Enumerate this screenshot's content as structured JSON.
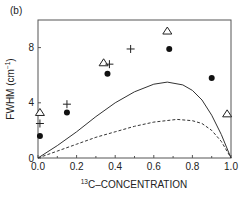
{
  "panel_label": "(b)",
  "chart_data": {
    "type": "scatter",
    "title": "",
    "xlabel_sup": "13",
    "xlabel": "C–CONCENTRATION",
    "ylabel": "FWHM (cm",
    "ylabel_sup": "−1",
    "ylabel_end": ")",
    "xlim": [
      0,
      1.0
    ],
    "ylim": [
      0,
      10
    ],
    "xticks": [
      0.0,
      0.2,
      0.4,
      0.6,
      0.8,
      1.0
    ],
    "xtick_labels": [
      "0.0",
      "0.2",
      "0.4",
      "0.6",
      "0.8",
      "1.0"
    ],
    "yticks": [
      0,
      4,
      8
    ],
    "ytick_labels": [
      "0",
      "4",
      "8"
    ],
    "grid": false,
    "legend": null,
    "series": [
      {
        "name": "triangles",
        "marker": "open-triangle",
        "points": [
          [
            0.01,
            3.3
          ],
          [
            0.34,
            6.9
          ],
          [
            0.67,
            9.2
          ],
          [
            0.98,
            3.2
          ]
        ]
      },
      {
        "name": "plus",
        "marker": "plus",
        "points": [
          [
            0.01,
            2.5
          ],
          [
            0.15,
            3.9
          ],
          [
            0.37,
            6.8
          ],
          [
            0.48,
            7.9
          ]
        ]
      },
      {
        "name": "filled-circles",
        "marker": "filled-circle",
        "points": [
          [
            0.01,
            1.6
          ],
          [
            0.15,
            3.3
          ],
          [
            0.36,
            6.1
          ],
          [
            0.68,
            7.9
          ],
          [
            0.9,
            5.8
          ]
        ]
      },
      {
        "name": "solid-curve",
        "style": "solid-line",
        "points": [
          [
            0,
            0
          ],
          [
            0.1,
            0.9
          ],
          [
            0.2,
            1.9
          ],
          [
            0.3,
            3.0
          ],
          [
            0.4,
            4.0
          ],
          [
            0.5,
            4.8
          ],
          [
            0.6,
            5.35
          ],
          [
            0.67,
            5.5
          ],
          [
            0.75,
            5.3
          ],
          [
            0.8,
            4.9
          ],
          [
            0.85,
            4.2
          ],
          [
            0.9,
            3.1
          ],
          [
            0.95,
            1.7
          ],
          [
            1.0,
            0
          ]
        ]
      },
      {
        "name": "dashed-curve",
        "style": "dashed-line",
        "points": [
          [
            0,
            0
          ],
          [
            0.1,
            0.5
          ],
          [
            0.2,
            1.0
          ],
          [
            0.3,
            1.5
          ],
          [
            0.4,
            1.9
          ],
          [
            0.5,
            2.3
          ],
          [
            0.6,
            2.6
          ],
          [
            0.72,
            2.8
          ],
          [
            0.8,
            2.7
          ],
          [
            0.85,
            2.5
          ],
          [
            0.9,
            2.0
          ],
          [
            0.95,
            1.2
          ],
          [
            1.0,
            0
          ]
        ]
      }
    ]
  }
}
